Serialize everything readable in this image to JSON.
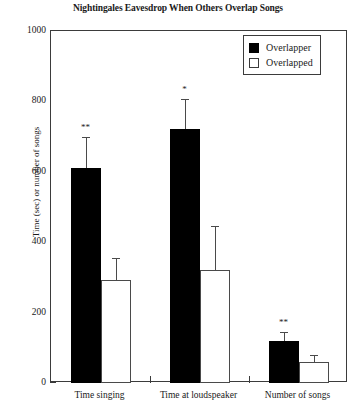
{
  "chart_data": {
    "type": "bar",
    "title": "Nightingales Eavesdrop When Others Overlap Songs",
    "xlabel": "",
    "ylabel": "Time (sec) or number of songs",
    "ylim": [
      0,
      1000
    ],
    "ytick_step": 200,
    "yminor_step": 100,
    "grid": false,
    "legend_position": "top-right",
    "categories": [
      "Time singing",
      "Time at loudspeaker",
      "Number of songs"
    ],
    "ytick_labels": [
      "0",
      "200",
      "400",
      "600",
      "800",
      "1000"
    ],
    "series": [
      {
        "name": "Overlapper",
        "style": "filled",
        "color": "#000000",
        "values": [
          610,
          722,
          120
        ],
        "errors": [
          90,
          85,
          25
        ],
        "significance": [
          "**",
          "*",
          "**"
        ]
      },
      {
        "name": "Overlapped",
        "style": "open",
        "color": "#ffffff",
        "values": [
          293,
          320,
          60
        ],
        "errors": [
          62,
          125,
          20
        ],
        "significance": [
          "",
          "",
          ""
        ]
      }
    ]
  },
  "legend": {
    "items": [
      {
        "label": "Overlapper",
        "style": "filled"
      },
      {
        "label": "Overlapped",
        "style": "open"
      }
    ]
  }
}
